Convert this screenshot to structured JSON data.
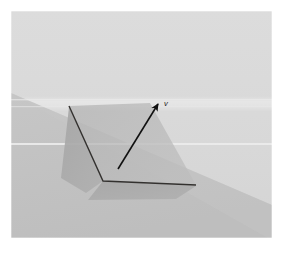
{
  "figure": {
    "canvas": {
      "width": 282,
      "height": 254
    },
    "page_background": "#ffffff"
  },
  "image_panel": {
    "name": "rendered-3d-scene",
    "bounds": {
      "x": 11,
      "y": 11,
      "width": 261,
      "height": 227
    },
    "border_color": "#ffffff"
  },
  "scene": {
    "sky": {
      "label": "upper-background-plane",
      "color": "#d8d8d8"
    },
    "ground": {
      "label": "ground-plane",
      "color": "#c2c2c2"
    },
    "ground_far": {
      "label": "ground-plane-far",
      "color": "#cccccc"
    },
    "highlight_band": {
      "label": "horizon-highlight-band",
      "color": "#e4e4e4"
    },
    "scanline": {
      "label": "horizontal-scanline",
      "color": "#ececec",
      "y": 144
    },
    "shadow": {
      "label": "cast-shadow",
      "color": "#a9a9a9"
    },
    "fold_fill": {
      "label": "folded-surface-fill",
      "color": "#b8b8b8"
    },
    "fold_edge": {
      "label": "fold-crease-edge",
      "color": "#33312f",
      "stroke_width": 1.4
    }
  },
  "vector": {
    "name": "vector-arrow",
    "label": "v",
    "color": "#111111",
    "stroke_width": 1.6,
    "tail": {
      "x": 118,
      "y": 169
    },
    "tip": {
      "x": 158,
      "y": 104
    },
    "label_position": {
      "x": 164,
      "y": 106
    }
  },
  "corner_artifact": {
    "label": "faint-corner-mark",
    "text": "·",
    "x": 14,
    "y": 247
  }
}
